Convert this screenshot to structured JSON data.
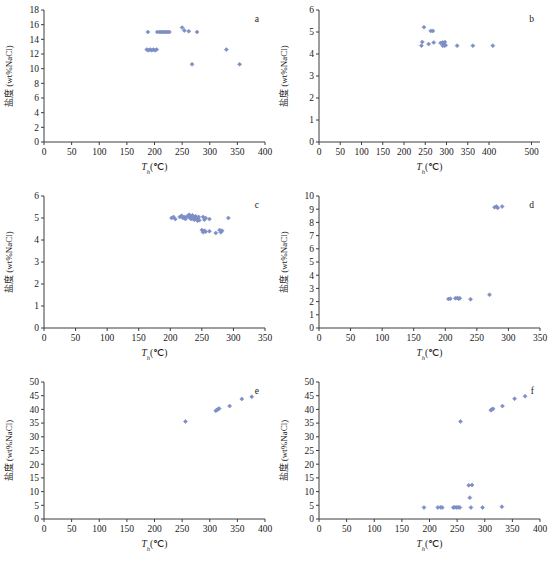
{
  "figure": {
    "marker_color": "#7c8ec6",
    "axis_color": "#3c3c3c",
    "text_color": "#1a1a1a",
    "bottom_caption": ""
  },
  "chart_data": [
    {
      "type": "scatter",
      "panel": "a",
      "title": "",
      "xlabel": "T",
      "xlabel_sub": "h",
      "xlabel_unit": "(℃)",
      "ylabel": "盐度 (wt%NaCl)",
      "xlim": [
        0,
        400
      ],
      "ylim": [
        0,
        18
      ],
      "xticks": [
        0,
        50,
        100,
        150,
        200,
        250,
        300,
        350,
        400
      ],
      "xticklabels": [
        "0",
        "50",
        "100",
        "150",
        "200",
        "250",
        "300",
        "350",
        "400"
      ],
      "yticks": [
        0,
        2,
        4,
        6,
        8,
        10,
        12,
        14,
        16,
        18
      ],
      "yticklabels": [
        "0",
        "2",
        "4",
        "6",
        "8",
        "10",
        "12",
        "14",
        "16",
        "18"
      ],
      "grid": false,
      "legend": "none",
      "points": [
        [
          188,
          15.0
        ],
        [
          205,
          15.0
        ],
        [
          209,
          15.0
        ],
        [
          212,
          15.0
        ],
        [
          215,
          15.0
        ],
        [
          218,
          15.0
        ],
        [
          221,
          15.0
        ],
        [
          224,
          15.0
        ],
        [
          227,
          15.0
        ],
        [
          250,
          15.6
        ],
        [
          254,
          15.2
        ],
        [
          262,
          15.1
        ],
        [
          277,
          15.0
        ],
        [
          186,
          12.6
        ],
        [
          189,
          12.5
        ],
        [
          192,
          12.6
        ],
        [
          195,
          12.5
        ],
        [
          198,
          12.6
        ],
        [
          201,
          12.5
        ],
        [
          204,
          12.6
        ],
        [
          330,
          12.6
        ],
        [
          268,
          10.6
        ],
        [
          354,
          10.6
        ]
      ]
    },
    {
      "type": "scatter",
      "panel": "b",
      "title": "",
      "xlabel": "T",
      "xlabel_sub": "h",
      "xlabel_unit": "(℃)",
      "ylabel": "盐度 (wt%NaCl)",
      "xlim": [
        0,
        520
      ],
      "ylim": [
        0,
        6
      ],
      "xticks": [
        0,
        50,
        100,
        150,
        200,
        250,
        300,
        350,
        400,
        500
      ],
      "xticklabels": [
        "0",
        "50",
        "100",
        "150",
        "200",
        "250",
        "300",
        "350",
        "400",
        "500"
      ],
      "yticks": [
        0,
        1,
        2,
        3,
        4,
        5,
        6
      ],
      "yticklabels": [
        "0",
        "1",
        "2",
        "3",
        "4",
        "5",
        "6"
      ],
      "grid": false,
      "legend": "none",
      "points": [
        [
          247,
          5.22
        ],
        [
          263,
          5.05
        ],
        [
          268,
          5.05
        ],
        [
          243,
          4.55
        ],
        [
          241,
          4.38
        ],
        [
          258,
          4.45
        ],
        [
          270,
          4.52
        ],
        [
          286,
          4.5
        ],
        [
          290,
          4.52
        ],
        [
          293,
          4.48
        ],
        [
          296,
          4.55
        ],
        [
          291,
          4.38
        ],
        [
          295,
          4.38
        ],
        [
          298,
          4.4
        ],
        [
          325,
          4.38
        ],
        [
          362,
          4.38
        ],
        [
          409,
          4.38
        ]
      ]
    },
    {
      "type": "scatter",
      "panel": "c",
      "title": "",
      "xlabel": "T",
      "xlabel_sub": "h",
      "xlabel_unit": "(℃)",
      "ylabel": "盐度 (wt%NaCl)",
      "xlim": [
        0,
        350
      ],
      "ylim": [
        0,
        6
      ],
      "xticks": [
        0,
        50,
        100,
        150,
        200,
        250,
        300,
        350
      ],
      "xticklabels": [
        "0",
        "50",
        "100",
        "150",
        "200",
        "250",
        "300",
        "350"
      ],
      "yticks": [
        0,
        1,
        2,
        3,
        4,
        5,
        6
      ],
      "yticklabels": [
        "0",
        "1",
        "2",
        "3",
        "4",
        "5",
        "6"
      ],
      "grid": false,
      "legend": "none",
      "points": [
        [
          202,
          5.0
        ],
        [
          205,
          5.05
        ],
        [
          208,
          4.95
        ],
        [
          215,
          5.05
        ],
        [
          218,
          5.1
        ],
        [
          220,
          5.0
        ],
        [
          222,
          5.05
        ],
        [
          224,
          4.95
        ],
        [
          226,
          5.05
        ],
        [
          228,
          5.1
        ],
        [
          230,
          5.15
        ],
        [
          231,
          5.0
        ],
        [
          232,
          5.08
        ],
        [
          233,
          4.95
        ],
        [
          234,
          5.05
        ],
        [
          235,
          5.12
        ],
        [
          236,
          4.98
        ],
        [
          237,
          5.05
        ],
        [
          238,
          4.92
        ],
        [
          239,
          5.0
        ],
        [
          240,
          5.08
        ],
        [
          241,
          4.95
        ],
        [
          242,
          5.02
        ],
        [
          243,
          4.88
        ],
        [
          244,
          4.96
        ],
        [
          245,
          5.05
        ],
        [
          246,
          4.9
        ],
        [
          252,
          5.05
        ],
        [
          254,
          4.92
        ],
        [
          256,
          5.0
        ],
        [
          262,
          4.95
        ],
        [
          292,
          5.0
        ],
        [
          250,
          4.45
        ],
        [
          252,
          4.35
        ],
        [
          254,
          4.42
        ],
        [
          256,
          4.38
        ],
        [
          262,
          4.4
        ],
        [
          272,
          4.32
        ],
        [
          278,
          4.45
        ],
        [
          280,
          4.35
        ],
        [
          282,
          4.42
        ]
      ]
    },
    {
      "type": "scatter",
      "panel": "d",
      "title": "",
      "xlabel": "T",
      "xlabel_sub": "h",
      "xlabel_unit": "(℃)",
      "ylabel": "盐度 (wt%NaCl)",
      "xlim": [
        0,
        350
      ],
      "ylim": [
        0,
        10
      ],
      "xticks": [
        0,
        50,
        100,
        150,
        200,
        250,
        300,
        350
      ],
      "xticklabels": [
        "0",
        "50",
        "100",
        "150",
        "200",
        "250",
        "300",
        "350"
      ],
      "yticks": [
        0,
        1,
        2,
        3,
        4,
        5,
        6,
        7,
        8,
        9,
        10
      ],
      "yticklabels": [
        "0",
        "1",
        "2",
        "3",
        "4",
        "5",
        "6",
        "7",
        "8",
        "9",
        "10"
      ],
      "grid": false,
      "legend": "none",
      "points": [
        [
          278,
          9.15
        ],
        [
          281,
          9.2
        ],
        [
          283,
          9.1
        ],
        [
          290,
          9.2
        ],
        [
          205,
          2.2
        ],
        [
          208,
          2.22
        ],
        [
          216,
          2.25
        ],
        [
          219,
          2.28
        ],
        [
          221,
          2.22
        ],
        [
          223,
          2.25
        ],
        [
          240,
          2.18
        ],
        [
          270,
          2.52
        ]
      ]
    },
    {
      "type": "scatter",
      "panel": "e",
      "title": "",
      "xlabel": "T",
      "xlabel_sub": "h",
      "xlabel_unit": "(℃)",
      "ylabel": "盐度 (wt%NaCl)",
      "xlim": [
        0,
        400
      ],
      "ylim": [
        0,
        50
      ],
      "xticks": [
        0,
        50,
        100,
        150,
        200,
        250,
        300,
        350,
        400
      ],
      "xticklabels": [
        "0",
        "50",
        "100",
        "150",
        "200",
        "250",
        "300",
        "350",
        "400"
      ],
      "yticks": [
        0,
        5,
        10,
        15,
        20,
        25,
        30,
        35,
        40,
        45,
        50
      ],
      "yticklabels": [
        "0",
        "5",
        "10",
        "15",
        "20",
        "25",
        "30",
        "35",
        "40",
        "45",
        "50"
      ],
      "grid": false,
      "legend": "none",
      "points": [
        [
          256,
          35.6
        ],
        [
          311,
          39.5
        ],
        [
          313,
          39.8
        ],
        [
          315,
          40.1
        ],
        [
          317,
          40.3
        ],
        [
          336,
          41.2
        ],
        [
          358,
          43.8
        ],
        [
          376,
          44.6
        ]
      ]
    },
    {
      "type": "scatter",
      "panel": "f",
      "title": "",
      "xlabel": "T",
      "xlabel_sub": "h",
      "xlabel_unit": "(℃)",
      "ylabel": "盐度 (wt%NaCl)",
      "xlim": [
        0,
        400
      ],
      "ylim": [
        0,
        50
      ],
      "xticks": [
        0,
        50,
        100,
        150,
        200,
        250,
        300,
        350,
        400
      ],
      "xticklabels": [
        "0",
        "50",
        "100",
        "150",
        "200",
        "250",
        "300",
        "350",
        "400"
      ],
      "yticks": [
        0,
        5,
        10,
        15,
        20,
        25,
        30,
        35,
        40,
        45,
        50
      ],
      "yticklabels": [
        "0",
        "5",
        "10",
        "15",
        "20",
        "25",
        "30",
        "35",
        "40",
        "45",
        "50"
      ],
      "grid": false,
      "legend": "none",
      "points": [
        [
          190,
          4.2
        ],
        [
          215,
          4.2
        ],
        [
          220,
          4.3
        ],
        [
          223,
          4.2
        ],
        [
          243,
          4.2
        ],
        [
          246,
          4.3
        ],
        [
          249,
          4.2
        ],
        [
          252,
          4.3
        ],
        [
          255,
          4.2
        ],
        [
          275,
          4.2
        ],
        [
          296,
          4.2
        ],
        [
          331,
          4.5
        ],
        [
          271,
          12.3
        ],
        [
          277,
          12.4
        ],
        [
          273,
          7.8
        ],
        [
          256,
          35.6
        ],
        [
          311,
          39.7
        ],
        [
          313,
          40.0
        ],
        [
          315,
          40.2
        ],
        [
          332,
          41.2
        ],
        [
          354,
          43.9
        ],
        [
          373,
          44.8
        ]
      ]
    }
  ]
}
